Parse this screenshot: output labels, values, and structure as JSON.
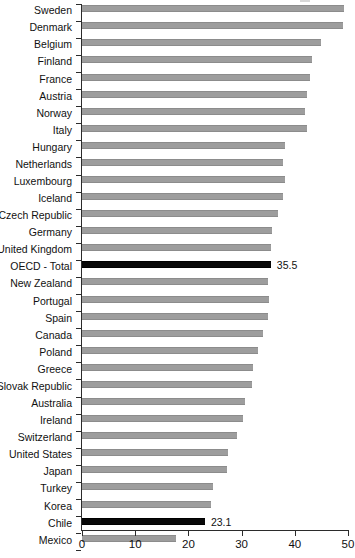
{
  "chart_data": {
    "type": "bar",
    "orientation": "horizontal",
    "title": "",
    "subtitle": "",
    "xlabel": "",
    "ylabel": "",
    "xlim": [
      0,
      50
    ],
    "xticks": [
      0,
      10,
      20,
      30,
      40,
      50
    ],
    "xtick_labels": [
      "0",
      "10",
      "20",
      "30",
      "40",
      "50"
    ],
    "grid": false,
    "legend": null,
    "series_name": "Value",
    "categories": [
      "Sweden",
      "Denmark",
      "Belgium",
      "Finland",
      "France",
      "Austria",
      "Norway",
      "Italy",
      "Hungary",
      "Netherlands",
      "Luxembourg",
      "Iceland",
      "Czech Republic",
      "Germany",
      "United Kingdom",
      "OECD - Total",
      "New Zealand",
      "Portugal",
      "Spain",
      "Canada",
      "Poland",
      "Greece",
      "Slovak Republic",
      "Australia",
      "Ireland",
      "Switzerland",
      "United States",
      "Japan",
      "Turkey",
      "Korea",
      "Chile",
      "Mexico"
    ],
    "values": [
      49.3,
      49.1,
      45.0,
      43.3,
      42.9,
      42.2,
      41.9,
      42.3,
      38.2,
      37.8,
      38.2,
      37.8,
      36.9,
      35.8,
      35.6,
      35.5,
      35.0,
      35.2,
      35.0,
      34.0,
      33.1,
      32.2,
      32.0,
      30.7,
      30.3,
      29.1,
      27.4,
      27.2,
      24.6,
      24.2,
      23.1,
      17.7
    ],
    "highlighted": [
      "OECD - Total",
      "Chile"
    ],
    "data_labels": {
      "OECD - Total": "35.5",
      "Chile": "23.1"
    },
    "colors": {
      "bar": "#9d9d9d",
      "bar_highlight": "#080808",
      "axis": "#2b2b2b",
      "text": "#111111",
      "background": "#ffffff"
    }
  }
}
